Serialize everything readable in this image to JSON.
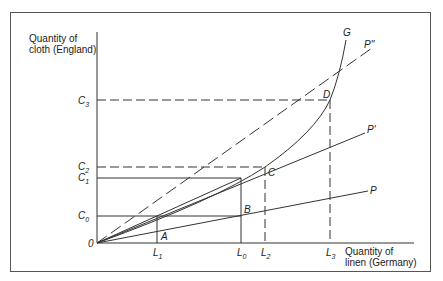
{
  "diagram": {
    "y_axis_title_line1": "Quantity of",
    "y_axis_title_line2": "cloth (England)",
    "x_axis_title_line1": "Quantity of",
    "x_axis_title_line2": "linen (Germany)",
    "origin_label": "0",
    "y_ticks": [
      {
        "label": "C",
        "sub": "3"
      },
      {
        "label": "C",
        "sub": "2"
      },
      {
        "label": "C",
        "sub": "1"
      },
      {
        "label": "C",
        "sub": "0"
      }
    ],
    "x_ticks": [
      {
        "label": "L",
        "sub": "1"
      },
      {
        "label": "L",
        "sub": "0"
      },
      {
        "label": "L",
        "sub": "2"
      },
      {
        "label": "L",
        "sub": "3"
      }
    ],
    "points": {
      "A": "A",
      "B": "B",
      "C": "C",
      "D": "D"
    },
    "curves": {
      "G": "G",
      "P": "P",
      "P1": "P'",
      "P2": "P\""
    },
    "line_color": "#333333"
  }
}
